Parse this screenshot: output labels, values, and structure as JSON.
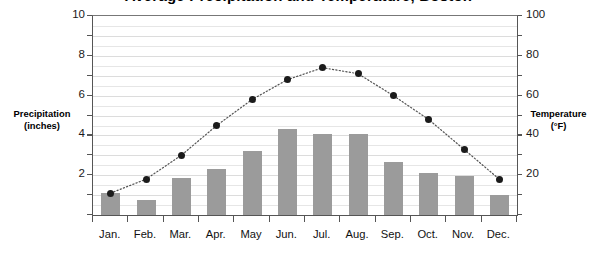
{
  "chart_data": {
    "type": "bar",
    "title": "Average Precipitation and Temperature, Boston",
    "categories": [
      "Jan.",
      "Feb.",
      "Mar.",
      "Apr.",
      "May",
      "Jun.",
      "Jul.",
      "Aug.",
      "Sep.",
      "Oct.",
      "Nov.",
      "Dec."
    ],
    "series": [
      {
        "name": "Precipitation (inches)",
        "type": "bar",
        "axis": "left",
        "color": "#9b9b9b",
        "values": [
          1.1,
          0.75,
          1.85,
          2.3,
          3.2,
          4.3,
          4.05,
          4.05,
          2.65,
          2.1,
          1.95,
          1.0
        ]
      },
      {
        "name": "Temperature (°F)",
        "type": "line",
        "axis": "right",
        "color": "#1b1b1b",
        "marker": "dot",
        "line_style": "dotted",
        "values": [
          11,
          18,
          30,
          45,
          58,
          68,
          74,
          71,
          60,
          48,
          33,
          18
        ]
      }
    ],
    "ylabel_left": "Precipitation\n(inches)",
    "ylabel_left_line1": "Precipitation",
    "ylabel_left_line2": "(inches)",
    "ylabel_right_line1": "Temperature",
    "ylabel_right_line2": "(°F)",
    "xlabel": "",
    "ylim_left": [
      0,
      10
    ],
    "ylim_right": [
      0,
      100
    ],
    "yticks_left": [
      0,
      2,
      4,
      6,
      8,
      10
    ],
    "yticks_left_labeled": [
      "2",
      "4",
      "6",
      "8",
      "10"
    ],
    "yticks_right": [
      0,
      20,
      40,
      60,
      80,
      100
    ],
    "yticks_right_labeled": [
      "20",
      "40",
      "60",
      "80",
      "100"
    ],
    "minor_tick_step_left": 1,
    "minor_tick_step_right": 10,
    "gridline_step_left": 0.5,
    "grid": true,
    "legend": "none"
  },
  "axis": {
    "left_labels": [
      {
        "text": "10",
        "value": 10
      },
      {
        "text": "8",
        "value": 8
      },
      {
        "text": "6",
        "value": 6
      },
      {
        "text": "4",
        "value": 4
      },
      {
        "text": "2",
        "value": 2
      }
    ],
    "right_labels": [
      {
        "text": "100",
        "value": 100
      },
      {
        "text": "80",
        "value": 80
      },
      {
        "text": "60",
        "value": 60
      },
      {
        "text": "40",
        "value": 40
      },
      {
        "text": "20",
        "value": 20
      }
    ]
  },
  "colors": {
    "bar": "#9b9b9b",
    "dot": "#1b1b1b",
    "grid": "#e6e6e6",
    "axis": "#555555",
    "text": "#111111",
    "background": "#ffffff"
  }
}
